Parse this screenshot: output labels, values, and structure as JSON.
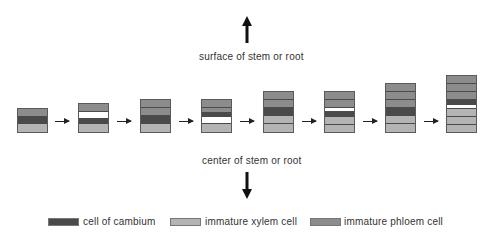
{
  "top_label": "surface of stem or root",
  "bottom_label": "center of stem or root",
  "colors": {
    "cambium": "#4a4a4a",
    "xylem": "#b4b4b4",
    "phloem": "#8c8c8c",
    "dividing": "#ffffff"
  },
  "stages": [
    {
      "cells_top_to_bottom": [
        "phloem",
        "cambium",
        "xylem"
      ]
    },
    {
      "cells_top_to_bottom": [
        "phloem",
        "dividing",
        "cambium",
        "xylem"
      ]
    },
    {
      "cells_top_to_bottom": [
        "phloem",
        "phloem",
        "cambium",
        "xylem"
      ]
    },
    {
      "cells_top_to_bottom": [
        "phloem",
        "phloem",
        "cambium",
        "dividing",
        "xylem"
      ]
    },
    {
      "cells_top_to_bottom": [
        "phloem",
        "phloem",
        "cambium",
        "xylem",
        "xylem"
      ]
    },
    {
      "cells_top_to_bottom": [
        "phloem",
        "phloem",
        "dividing",
        "cambium",
        "xylem",
        "xylem"
      ]
    },
    {
      "cells_top_to_bottom": [
        "phloem",
        "phloem",
        "phloem",
        "cambium",
        "xylem",
        "xylem"
      ]
    },
    {
      "cells_top_to_bottom": [
        "phloem",
        "phloem",
        "phloem",
        "cambium",
        "dividing",
        "xylem",
        "xylem",
        "xylem"
      ]
    }
  ],
  "legend": {
    "cambium": "cell of cambium",
    "xylem": "immature xylem cell",
    "phloem": "immature phloem cell"
  }
}
